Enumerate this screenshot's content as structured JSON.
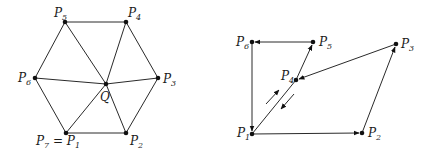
{
  "left_diagram": {
    "title": "hexagon fan triangulation around Q",
    "points": [
      {
        "id": "P1",
        "label": "P",
        "sub": "1",
        "prefix": "P",
        "prefix_sub": "7",
        "full_label": "P7 = P1",
        "x": 66,
        "y": 133
      },
      {
        "id": "P2",
        "label": "P",
        "sub": "2",
        "x": 126,
        "y": 133
      },
      {
        "id": "P3",
        "label": "P",
        "sub": "3",
        "x": 158,
        "y": 78
      },
      {
        "id": "P4",
        "label": "P",
        "sub": "4",
        "x": 126,
        "y": 22
      },
      {
        "id": "P5",
        "label": "P",
        "sub": "5",
        "x": 65,
        "y": 22
      },
      {
        "id": "P6",
        "label": "P",
        "sub": "6",
        "x": 35,
        "y": 78
      },
      {
        "id": "Q",
        "label": "Q",
        "sub": "",
        "x": 106,
        "y": 84
      }
    ],
    "labels": {
      "p1": "P7 = P1",
      "p2": "P2",
      "p3": "P3",
      "p4": "P4",
      "p5": "P5",
      "p6": "P6",
      "q": "Q"
    },
    "edges": [
      [
        "P1",
        "P2"
      ],
      [
        "P2",
        "P3"
      ],
      [
        "P3",
        "P4"
      ],
      [
        "P4",
        "P5"
      ],
      [
        "P5",
        "P6"
      ],
      [
        "P6",
        "P1"
      ],
      [
        "Q",
        "P1"
      ],
      [
        "Q",
        "P2"
      ],
      [
        "Q",
        "P3"
      ],
      [
        "Q",
        "P4"
      ],
      [
        "Q",
        "P5"
      ],
      [
        "Q",
        "P6"
      ]
    ]
  },
  "right_diagram": {
    "title": "directed polygon path with backtrack",
    "points": [
      {
        "id": "P1",
        "label": "P",
        "sub": "1",
        "x": 252,
        "y": 134
      },
      {
        "id": "P2",
        "label": "P",
        "sub": "2",
        "x": 362,
        "y": 133
      },
      {
        "id": "P3",
        "label": "P",
        "sub": "3",
        "x": 396,
        "y": 44
      },
      {
        "id": "P4",
        "label": "P",
        "sub": "4",
        "x": 296,
        "y": 80
      },
      {
        "id": "P5",
        "label": "P",
        "sub": "5",
        "x": 313,
        "y": 42
      },
      {
        "id": "P6",
        "label": "P",
        "sub": "6",
        "x": 252,
        "y": 42
      }
    ],
    "labels": {
      "p1": "P1",
      "p2": "P2",
      "p3": "P3",
      "p4": "P4",
      "p5": "P5",
      "p6": "P6"
    },
    "directed_edges": [
      [
        "P1",
        "P2"
      ],
      [
        "P2",
        "P3"
      ],
      [
        "P3",
        "P4"
      ],
      [
        "P4",
        "P5"
      ],
      [
        "P5",
        "P6"
      ],
      [
        "P6",
        "P1"
      ],
      [
        "P1",
        "P4"
      ]
    ],
    "side_arrows": [
      "up-right (P1 to P4)",
      "down-left (P4 to P1)"
    ]
  }
}
